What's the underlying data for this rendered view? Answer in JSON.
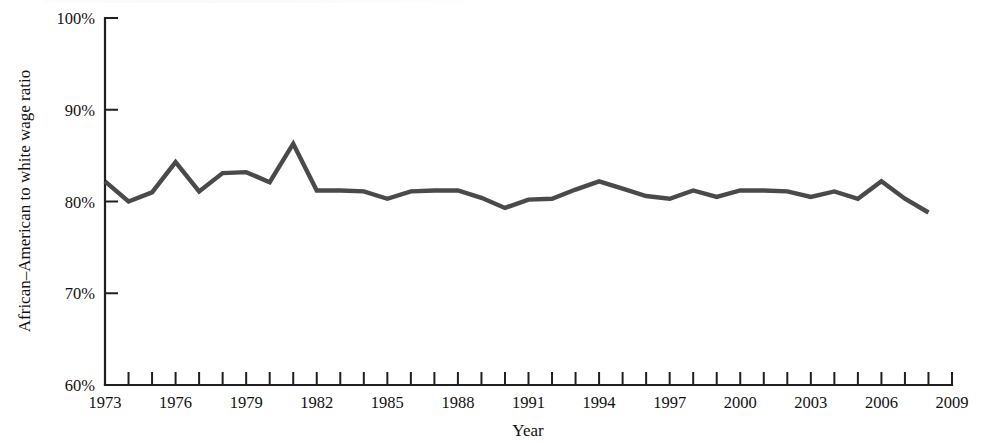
{
  "chart_data": {
    "type": "line",
    "title": "",
    "xlabel": "Year",
    "ylabel": "African–American to white wage ratio",
    "xlim": [
      1973,
      2009
    ],
    "ylim": [
      60,
      100
    ],
    "grid": false,
    "legend": null,
    "y_tick_labels": [
      "60%",
      "70%",
      "80%",
      "90%",
      "100%"
    ],
    "y_tick_values": [
      60,
      70,
      80,
      90,
      100
    ],
    "x_tick_values": [
      1973,
      1974,
      1975,
      1976,
      1977,
      1978,
      1979,
      1980,
      1981,
      1982,
      1983,
      1984,
      1985,
      1986,
      1987,
      1988,
      1989,
      1990,
      1991,
      1992,
      1993,
      1994,
      1995,
      1996,
      1997,
      1998,
      1999,
      2000,
      2001,
      2002,
      2003,
      2004,
      2005,
      2006,
      2007,
      2008,
      2009
    ],
    "x_tick_labels_shown": [
      "1973",
      "1976",
      "1979",
      "1982",
      "1985",
      "1988",
      "1991",
      "1994",
      "1997",
      "2000",
      "2003",
      "2006",
      "2009"
    ],
    "x_label_interval": 3,
    "series": [
      {
        "name": "African-American to white wage ratio",
        "color": "#4a4a4a",
        "x": [
          1973,
          1974,
          1975,
          1976,
          1977,
          1978,
          1979,
          1980,
          1981,
          1982,
          1983,
          1984,
          1985,
          1986,
          1987,
          1988,
          1989,
          1990,
          1991,
          1992,
          1993,
          1994,
          1995,
          1996,
          1997,
          1998,
          1999,
          2000,
          2001,
          2002,
          2003,
          2004,
          2005,
          2006,
          2007,
          2008
        ],
        "values": [
          82.2,
          80.0,
          81.0,
          84.3,
          81.1,
          83.1,
          83.2,
          82.1,
          86.3,
          81.2,
          81.2,
          81.1,
          80.3,
          81.1,
          81.2,
          81.2,
          80.4,
          79.3,
          80.2,
          80.3,
          81.3,
          82.2,
          81.4,
          80.6,
          80.3,
          81.2,
          80.5,
          81.2,
          81.2,
          81.1,
          80.5,
          81.1,
          80.3,
          82.2,
          80.3,
          78.8
        ]
      }
    ]
  },
  "axis": {
    "y_title": "African–American to white wage ratio",
    "x_title": "Year"
  }
}
